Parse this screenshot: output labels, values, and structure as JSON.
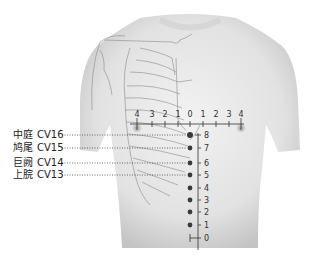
{
  "figure": {
    "colors": {
      "skin": "#e8e8e8",
      "shadow": "#b9b9b9",
      "lines": "#8a8a8a",
      "points": "#3a3a3a",
      "text": "#222222"
    }
  },
  "points": [
    {
      "zh": "中庭",
      "code": "CV16",
      "level": 8
    },
    {
      "zh": "鸠尾",
      "code": "CV15",
      "level": 7
    },
    {
      "zh": "巨阙",
      "code": "CV14",
      "level": 6
    },
    {
      "zh": "上脘",
      "code": "CV13",
      "level": 5
    }
  ],
  "horizontal_scale": {
    "ticks": [
      "4",
      "3",
      "2",
      "1",
      "0",
      "1",
      "2",
      "3",
      "4"
    ]
  },
  "vertical_scale": {
    "ticks": [
      "8",
      "7",
      "6",
      "5",
      "4",
      "3",
      "2",
      "1",
      "0"
    ]
  }
}
